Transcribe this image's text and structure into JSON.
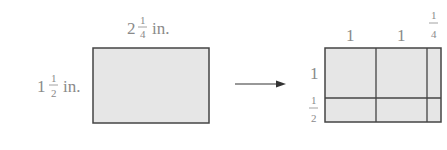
{
  "diagram": {
    "left_rect": {
      "width_label": {
        "whole": "2",
        "num": "1",
        "den": "4",
        "unit": "in."
      },
      "height_label": {
        "whole": "1",
        "num": "1",
        "den": "2",
        "unit": "in."
      }
    },
    "arrow": {
      "direction": "right"
    },
    "right_rect": {
      "column_labels": [
        {
          "type": "whole",
          "text": "1"
        },
        {
          "type": "whole",
          "text": "1"
        },
        {
          "type": "fraction",
          "num": "1",
          "den": "4"
        }
      ],
      "row_labels": [
        {
          "type": "whole",
          "text": "1"
        },
        {
          "type": "fraction",
          "num": "1",
          "den": "2"
        }
      ]
    },
    "colors": {
      "fill": "#e6e6e6",
      "stroke": "#444444",
      "text": "#8a8a8a"
    }
  }
}
